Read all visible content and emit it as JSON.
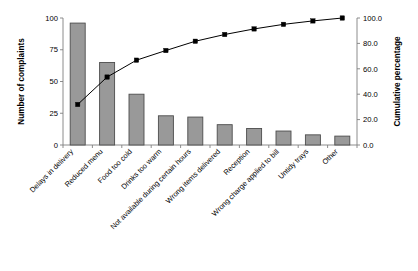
{
  "chart_data": {
    "type": "bar",
    "title": "",
    "subtitle": "",
    "xlabel": "",
    "ylabel": "Number of complaints",
    "y2label": "Cumulative percentage",
    "ylim": [
      0,
      100
    ],
    "y2lim": [
      0.0,
      100.0
    ],
    "yticks": [
      "0",
      "25",
      "50",
      "75",
      "100"
    ],
    "ytick_values": [
      0,
      25,
      50,
      75,
      100
    ],
    "y2ticks": [
      "0.0",
      "20.0",
      "40.0",
      "60.0",
      "80.0",
      "100.0"
    ],
    "y2tick_values": [
      0,
      20,
      40,
      60,
      80,
      100
    ],
    "grid": false,
    "legend": false,
    "legend_position": "none",
    "bar_color": "#999999",
    "bar_edge_color": "#4d4d4d",
    "line_color": "#000000",
    "marker_color": "#000000",
    "categories": [
      "Delays in delivery",
      "Reduced menu",
      "Food too cold",
      "Drinks too warm",
      "Not available during certain hours",
      "Wrong items delivered",
      "Reception",
      "Wrong charge applied to bill",
      "Untidy trays",
      "Other"
    ],
    "series": [
      {
        "name": "Number of complaints",
        "axis": "left",
        "type": "bar",
        "values": [
          96,
          65,
          40,
          23,
          22,
          16,
          13,
          11,
          8,
          7
        ]
      },
      {
        "name": "Cumulative percentage",
        "axis": "right",
        "type": "line",
        "values": [
          31.9,
          53.5,
          66.8,
          74.4,
          81.7,
          87.0,
          91.4,
          95.0,
          97.7,
          100.0
        ]
      }
    ]
  }
}
